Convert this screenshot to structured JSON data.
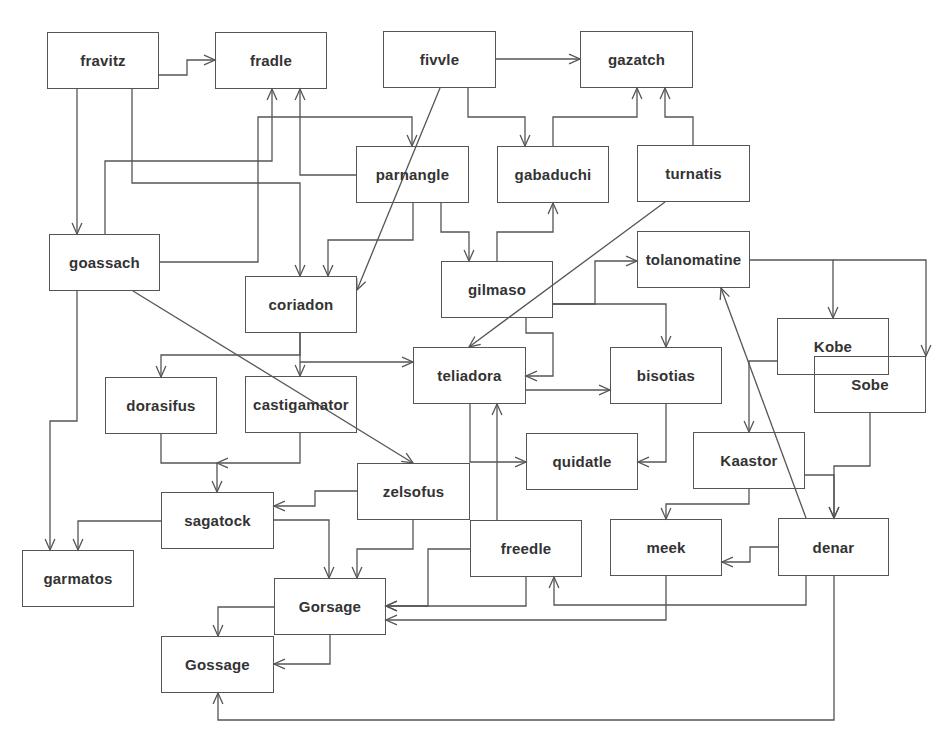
{
  "diagram": {
    "type": "directed-graph",
    "stroke_color": "#555555",
    "text_color": "#333333",
    "nodes": [
      {
        "id": "fravitz",
        "label": "fravitz",
        "box": [
          47,
          32,
          159,
          89
        ]
      },
      {
        "id": "fradle",
        "label": "fradle",
        "box": [
          215,
          32,
          327,
          89
        ]
      },
      {
        "id": "fivvle",
        "label": "fivvle",
        "box": [
          383,
          31,
          496,
          88
        ]
      },
      {
        "id": "gazatch",
        "label": "gazatch",
        "box": [
          580,
          31,
          693,
          88
        ]
      },
      {
        "id": "parnangle",
        "label": "parnangle",
        "box": [
          356,
          146,
          469,
          203
        ]
      },
      {
        "id": "gabaduchi",
        "label": "gabaduchi",
        "box": [
          497,
          146,
          609,
          203
        ]
      },
      {
        "id": "turnatis",
        "label": "turnatis",
        "box": [
          637,
          145,
          750,
          202
        ]
      },
      {
        "id": "goassach",
        "label": "goassach",
        "box": [
          49,
          234,
          160,
          291
        ]
      },
      {
        "id": "coriadon",
        "label": "coriadon",
        "box": [
          245,
          276,
          357,
          333
        ]
      },
      {
        "id": "gilmaso",
        "label": "gilmaso",
        "box": [
          441,
          261,
          553,
          318
        ]
      },
      {
        "id": "tolanomatine",
        "label": "tolanomatine",
        "box": [
          637,
          231,
          750,
          288
        ]
      },
      {
        "id": "Kobe",
        "label": "Kobe",
        "box": [
          777,
          318,
          889,
          375
        ]
      },
      {
        "id": "Sobe",
        "label": "Sobe",
        "box": [
          814,
          356,
          926,
          413
        ]
      },
      {
        "id": "teliadora",
        "label": "teliadora",
        "box": [
          413,
          347,
          526,
          404
        ]
      },
      {
        "id": "bisotias",
        "label": "bisotias",
        "box": [
          610,
          347,
          722,
          404
        ]
      },
      {
        "id": "dorasifus",
        "label": "dorasifus",
        "box": [
          105,
          377,
          217,
          434
        ]
      },
      {
        "id": "castigamator",
        "label": "castigamator",
        "box": [
          245,
          376,
          357,
          433
        ]
      },
      {
        "id": "quidatle",
        "label": "quidatle",
        "box": [
          526,
          433,
          638,
          490
        ]
      },
      {
        "id": "Kaastor",
        "label": "Kaastor",
        "box": [
          693,
          432,
          805,
          489
        ]
      },
      {
        "id": "zelsofus",
        "label": "zelsofus",
        "box": [
          357,
          463,
          470,
          520
        ]
      },
      {
        "id": "sagatock",
        "label": "sagatock",
        "box": [
          161,
          492,
          274,
          549
        ]
      },
      {
        "id": "freedle",
        "label": "freedle",
        "box": [
          470,
          520,
          582,
          577
        ]
      },
      {
        "id": "meek",
        "label": "meek",
        "box": [
          610,
          519,
          722,
          576
        ]
      },
      {
        "id": "denar",
        "label": "denar",
        "box": [
          778,
          518,
          889,
          576
        ]
      },
      {
        "id": "garmatos",
        "label": "garmatos",
        "box": [
          22,
          550,
          134,
          607
        ]
      },
      {
        "id": "Gorsage",
        "label": "Gorsage",
        "box": [
          274,
          578,
          386,
          635
        ]
      },
      {
        "id": "Gossage",
        "label": "Gossage",
        "box": [
          161,
          636,
          274,
          693
        ]
      }
    ],
    "edges": [
      {
        "from": "fravitz",
        "to": "fradle",
        "points": [
          [
            159,
            75
          ],
          [
            187,
            75
          ],
          [
            187,
            60
          ],
          [
            215,
            60
          ]
        ]
      },
      {
        "from": "fravitz",
        "to": "goassach",
        "points": [
          [
            77,
            89
          ],
          [
            77,
            234
          ]
        ]
      },
      {
        "from": "fravitz",
        "to": "coriadon",
        "points": [
          [
            132,
            89
          ],
          [
            132,
            183
          ],
          [
            300,
            183
          ],
          [
            300,
            276
          ]
        ]
      },
      {
        "from": "fivvle",
        "to": "gazatch",
        "points": [
          [
            496,
            59
          ],
          [
            580,
            59
          ]
        ]
      },
      {
        "from": "fivvle",
        "to": "gabaduchi",
        "points": [
          [
            468,
            88
          ],
          [
            468,
            117
          ],
          [
            525,
            117
          ],
          [
            525,
            146
          ]
        ]
      },
      {
        "from": "fivvle",
        "to": "coriadon",
        "points": [
          [
            440,
            88
          ],
          [
            357,
            290
          ]
        ]
      },
      {
        "from": "goassach",
        "to": "fradle",
        "points": [
          [
            105,
            234
          ],
          [
            105,
            161
          ],
          [
            272,
            161
          ],
          [
            272,
            89
          ]
        ]
      },
      {
        "from": "goassach",
        "to": "parnangle",
        "points": [
          [
            160,
            262
          ],
          [
            258,
            262
          ],
          [
            258,
            117
          ],
          [
            412,
            117
          ],
          [
            412,
            146
          ]
        ]
      },
      {
        "from": "goassach",
        "to": "zelsofus",
        "points": [
          [
            133,
            291
          ],
          [
            413,
            463
          ]
        ]
      },
      {
        "from": "goassach",
        "to": "garmatos",
        "points": [
          [
            77,
            291
          ],
          [
            77,
            421
          ],
          [
            50,
            421
          ],
          [
            50,
            550
          ]
        ]
      },
      {
        "from": "parnangle",
        "to": "fradle",
        "points": [
          [
            356,
            175
          ],
          [
            300,
            175
          ],
          [
            300,
            89
          ]
        ]
      },
      {
        "from": "parnangle",
        "to": "coriadon",
        "points": [
          [
            413,
            203
          ],
          [
            413,
            240
          ],
          [
            328,
            240
          ],
          [
            328,
            276
          ]
        ]
      },
      {
        "from": "parnangle",
        "to": "gilmaso",
        "points": [
          [
            441,
            203
          ],
          [
            441,
            232
          ],
          [
            469,
            232
          ],
          [
            469,
            261
          ]
        ]
      },
      {
        "from": "gabaduchi",
        "to": "gazatch",
        "points": [
          [
            553,
            146
          ],
          [
            553,
            117
          ],
          [
            637,
            117
          ],
          [
            637,
            88
          ]
        ]
      },
      {
        "from": "turnatis",
        "to": "gazatch",
        "points": [
          [
            693,
            145
          ],
          [
            693,
            117
          ],
          [
            665,
            117
          ],
          [
            665,
            88
          ]
        ]
      },
      {
        "from": "turnatis",
        "to": "teliadora",
        "points": [
          [
            665,
            202
          ],
          [
            469,
            347
          ]
        ]
      },
      {
        "from": "gilmaso",
        "to": "gabaduchi",
        "points": [
          [
            497,
            261
          ],
          [
            497,
            232
          ],
          [
            553,
            232
          ],
          [
            553,
            203
          ]
        ]
      },
      {
        "from": "gilmaso",
        "to": "tolanomatine",
        "points": [
          [
            553,
            304
          ],
          [
            595,
            304
          ],
          [
            595,
            261
          ],
          [
            637,
            261
          ]
        ]
      },
      {
        "from": "gilmaso",
        "to": "bisotias",
        "points": [
          [
            553,
            304
          ],
          [
            666,
            304
          ],
          [
            666,
            347
          ]
        ]
      },
      {
        "from": "gilmaso",
        "to": "teliadora",
        "points": [
          [
            526,
            318
          ],
          [
            526,
            333
          ],
          [
            553,
            333
          ],
          [
            553,
            376
          ],
          [
            526,
            376
          ]
        ]
      },
      {
        "from": "coriadon",
        "to": "dorasifus",
        "points": [
          [
            300,
            333
          ],
          [
            300,
            355
          ],
          [
            161,
            355
          ],
          [
            161,
            377
          ]
        ]
      },
      {
        "from": "coriadon",
        "to": "castigamator",
        "points": [
          [
            300,
            333
          ],
          [
            300,
            376
          ]
        ]
      },
      {
        "from": "coriadon",
        "to": "teliadora",
        "points": [
          [
            300,
            362
          ],
          [
            413,
            362
          ]
        ]
      },
      {
        "from": "tolanomatine",
        "to": "Kobe",
        "points": [
          [
            750,
            260
          ],
          [
            833,
            260
          ],
          [
            833,
            318
          ]
        ]
      },
      {
        "from": "tolanomatine",
        "to": "Sobe",
        "points": [
          [
            833,
            260
          ],
          [
            926,
            260
          ],
          [
            926,
            356
          ]
        ]
      },
      {
        "from": "Kobe",
        "to": "Kaastor",
        "points": [
          [
            777,
            361
          ],
          [
            749,
            361
          ],
          [
            749,
            432
          ]
        ]
      },
      {
        "from": "teliadora",
        "to": "bisotias",
        "points": [
          [
            526,
            390
          ],
          [
            610,
            390
          ]
        ]
      },
      {
        "from": "teliadora",
        "to": "quidatle",
        "points": [
          [
            470,
            404
          ],
          [
            470,
            462
          ],
          [
            526,
            462
          ]
        ]
      },
      {
        "from": "bisotias",
        "to": "quidatle",
        "points": [
          [
            666,
            404
          ],
          [
            666,
            462
          ],
          [
            638,
            462
          ]
        ]
      },
      {
        "from": "dorasifus",
        "to": "sagatock",
        "points": [
          [
            161,
            434
          ],
          [
            161,
            463
          ],
          [
            217,
            463
          ],
          [
            217,
            492
          ]
        ]
      },
      {
        "from": "castigamator",
        "to": "sagatock",
        "points": [
          [
            300,
            433
          ],
          [
            300,
            463
          ],
          [
            217,
            463
          ]
        ]
      },
      {
        "from": "zelsofus",
        "to": "sagatock",
        "points": [
          [
            357,
            491
          ],
          [
            315,
            491
          ],
          [
            315,
            506
          ],
          [
            274,
            506
          ]
        ]
      },
      {
        "from": "zelsofus",
        "to": "Gorsage",
        "points": [
          [
            413,
            520
          ],
          [
            413,
            549
          ],
          [
            357,
            549
          ],
          [
            357,
            578
          ]
        ]
      },
      {
        "from": "sagatock",
        "to": "garmatos",
        "points": [
          [
            161,
            521
          ],
          [
            78,
            521
          ],
          [
            78,
            550
          ]
        ]
      },
      {
        "from": "sagatock",
        "to": "Gorsage",
        "points": [
          [
            274,
            520
          ],
          [
            329,
            520
          ],
          [
            329,
            578
          ]
        ]
      },
      {
        "from": "freedle",
        "to": "teliadora",
        "points": [
          [
            497,
            520
          ],
          [
            497,
            404
          ]
        ]
      },
      {
        "from": "freedle",
        "to": "Gorsage",
        "points": [
          [
            470,
            549
          ],
          [
            428,
            549
          ],
          [
            428,
            606
          ],
          [
            386,
            606
          ]
        ]
      },
      {
        "from": "freedle",
        "to": "Gorsage",
        "points": [
          [
            526,
            577
          ],
          [
            526,
            606
          ],
          [
            386,
            606
          ]
        ]
      },
      {
        "from": "meek",
        "to": "Gorsage",
        "points": [
          [
            666,
            576
          ],
          [
            666,
            620
          ],
          [
            386,
            620
          ]
        ]
      },
      {
        "from": "Kaastor",
        "to": "meek",
        "points": [
          [
            749,
            489
          ],
          [
            749,
            504
          ],
          [
            666,
            504
          ],
          [
            666,
            519
          ]
        ]
      },
      {
        "from": "Kaastor",
        "to": "denar",
        "points": [
          [
            805,
            475
          ],
          [
            834,
            475
          ],
          [
            834,
            518
          ]
        ]
      },
      {
        "from": "Sobe",
        "to": "denar",
        "points": [
          [
            870,
            413
          ],
          [
            870,
            466
          ],
          [
            834,
            466
          ],
          [
            834,
            518
          ]
        ]
      },
      {
        "from": "denar",
        "to": "tolanomatine",
        "points": [
          [
            806,
            518
          ],
          [
            721,
            288
          ]
        ]
      },
      {
        "from": "denar",
        "to": "meek",
        "points": [
          [
            778,
            547
          ],
          [
            750,
            547
          ],
          [
            750,
            562
          ],
          [
            722,
            562
          ]
        ]
      },
      {
        "from": "denar",
        "to": "freedle",
        "points": [
          [
            806,
            576
          ],
          [
            806,
            605
          ],
          [
            554,
            605
          ],
          [
            554,
            577
          ]
        ]
      },
      {
        "from": "denar",
        "to": "Gossage",
        "points": [
          [
            834,
            576
          ],
          [
            834,
            720
          ],
          [
            218,
            720
          ],
          [
            218,
            693
          ]
        ]
      },
      {
        "from": "Gorsage",
        "to": "Gossage",
        "points": [
          [
            274,
            607
          ],
          [
            218,
            607
          ],
          [
            218,
            636
          ]
        ]
      },
      {
        "from": "Gorsage",
        "to": "Gossage",
        "points": [
          [
            330,
            635
          ],
          [
            330,
            664
          ],
          [
            274,
            664
          ]
        ]
      }
    ]
  }
}
